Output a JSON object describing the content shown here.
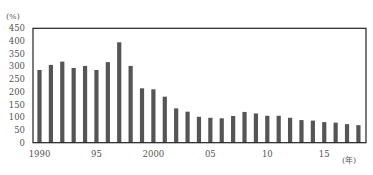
{
  "chart_data": {
    "type": "bar",
    "title": "",
    "xlabel": "(年)",
    "ylabel": "(%)",
    "ylim": [
      0,
      450
    ],
    "yticks": [
      0,
      50,
      100,
      150,
      200,
      250,
      300,
      350,
      400,
      450
    ],
    "x_tick_labels": [
      {
        "year": 1990,
        "label": "1990"
      },
      {
        "year": 1995,
        "label": "95"
      },
      {
        "year": 2000,
        "label": "2000"
      },
      {
        "year": 2005,
        "label": "05"
      },
      {
        "year": 2010,
        "label": "10"
      },
      {
        "year": 2015,
        "label": "15"
      }
    ],
    "categories": [
      1990,
      1991,
      1992,
      1993,
      1994,
      1995,
      1996,
      1997,
      1998,
      1999,
      2000,
      2001,
      2002,
      2003,
      2004,
      2005,
      2006,
      2007,
      2008,
      2009,
      2010,
      2011,
      2012,
      2013,
      2014,
      2015,
      2016,
      2017,
      2018
    ],
    "values": [
      286,
      306,
      319,
      294,
      302,
      286,
      317,
      395,
      302,
      214,
      210,
      181,
      135,
      122,
      102,
      98,
      96,
      105,
      121,
      115,
      106,
      106,
      98,
      89,
      87,
      81,
      79,
      73,
      69
    ],
    "grid": false,
    "legend": null,
    "bar_color": "#555555",
    "frame_color": "#222222"
  }
}
